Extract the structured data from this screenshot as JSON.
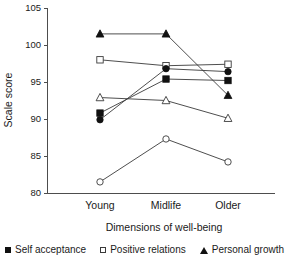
{
  "chart_data": {
    "type": "line",
    "title": "",
    "subtitle": "",
    "xlabel": "Dimensions of well-being",
    "ylabel": "Scale score",
    "categories": [
      "Young",
      "Midlife",
      "Older"
    ],
    "ylim": [
      80,
      105
    ],
    "yticks": [
      80,
      85,
      90,
      95,
      100,
      105
    ],
    "ytick_labels": [
      "80",
      "85",
      "90",
      "95",
      "100",
      "105"
    ],
    "grid": false,
    "legend_position": "bottom",
    "series": [
      {
        "name": "Self acceptance",
        "marker": "filled-square",
        "values": [
          90.8,
          95.4,
          95.2
        ],
        "in_legend": true
      },
      {
        "name": "Positive relations",
        "marker": "open-square",
        "values": [
          98.0,
          97.2,
          97.4
        ],
        "in_legend": true
      },
      {
        "name": "Personal growth",
        "marker": "filled-triangle",
        "values": [
          101.5,
          101.5,
          93.2
        ],
        "in_legend": true
      },
      {
        "name": "",
        "marker": "filled-circle",
        "values": [
          89.9,
          96.8,
          96.4
        ],
        "in_legend": false
      },
      {
        "name": "",
        "marker": "open-triangle",
        "values": [
          92.9,
          92.5,
          90.1
        ],
        "in_legend": false
      },
      {
        "name": "",
        "marker": "open-circle",
        "values": [
          81.5,
          87.3,
          84.2
        ],
        "in_legend": false
      }
    ]
  },
  "legend": {
    "items": [
      {
        "label": "Self acceptance",
        "marker": "filled-square"
      },
      {
        "label": "Positive relations",
        "marker": "open-square"
      },
      {
        "label": "Personal growth",
        "marker": "filled-triangle"
      }
    ]
  },
  "colors": {
    "axis": "#4d4d4d",
    "line": "#3a3a3a",
    "marker_fill": "#111111",
    "marker_open": "#ffffff",
    "background": "#ffffff",
    "text": "#1a1a1a"
  }
}
